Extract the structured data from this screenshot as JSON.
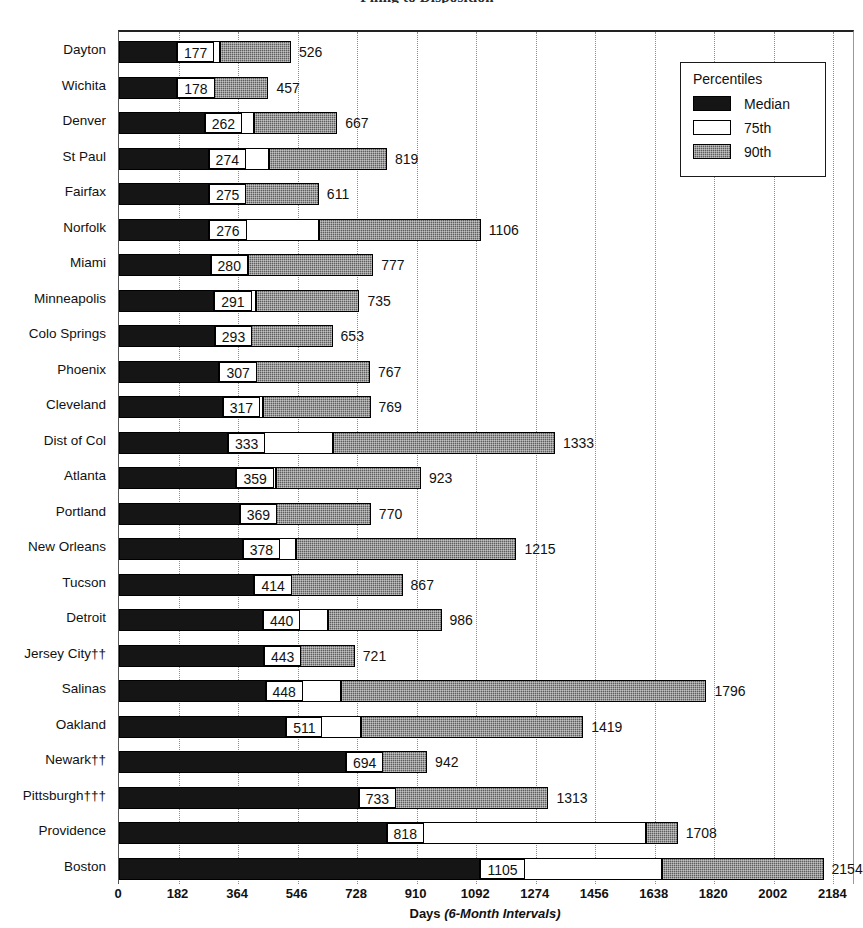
{
  "title": "Filing to Disposition",
  "legend": {
    "title": "Percentiles",
    "items": [
      {
        "label": "Median",
        "swatch": "black"
      },
      {
        "label": "75th",
        "swatch": "white"
      },
      {
        "label": "90th",
        "swatch": "hatched-gray"
      }
    ]
  },
  "axis": {
    "x_title_bold": "Days",
    "x_title_italic": "(6-Month Intervals)",
    "ticks": [
      0,
      182,
      364,
      546,
      728,
      910,
      1092,
      1274,
      1456,
      1638,
      1820,
      2002,
      2184
    ],
    "min": 0,
    "max": 2244
  },
  "chart_data": {
    "type": "bar",
    "orientation": "horizontal",
    "stacked": true,
    "title": "Filing to Disposition",
    "xlabel": "Days (6-Month Intervals)",
    "ylabel": "",
    "xlim": [
      0,
      2244
    ],
    "grid": "vertical-dotted",
    "legend_position": "top-right",
    "series": [
      {
        "name": "Median",
        "key": "median"
      },
      {
        "name": "75th",
        "key": "p75"
      },
      {
        "name": "90th",
        "key": "p90"
      }
    ],
    "categories": [
      "Dayton",
      "Wichita",
      "Denver",
      "St Paul",
      "Fairfax",
      "Norfolk",
      "Miami",
      "Minneapolis",
      "Colo Springs",
      "Phoenix",
      "Cleveland",
      "Dist of Col",
      "Atlanta",
      "Portland",
      "New Orleans",
      "Tucson",
      "Detroit",
      "Jersey City††",
      "Salinas",
      "Oakland",
      "Newark††",
      "Pittsburgh†††",
      "Providence",
      "Boston"
    ],
    "rows": [
      {
        "category": "Dayton",
        "median": 177,
        "p75": 308,
        "p90": 526
      },
      {
        "category": "Wichita",
        "median": 178,
        "p75": 215,
        "p90": 457
      },
      {
        "category": "Denver",
        "median": 262,
        "p75": 414,
        "p90": 667
      },
      {
        "category": "St Paul",
        "median": 274,
        "p75": 460,
        "p90": 819
      },
      {
        "category": "Fairfax",
        "median": 275,
        "p75": 380,
        "p90": 611
      },
      {
        "category": "Norfolk",
        "median": 276,
        "p75": 610,
        "p90": 1106
      },
      {
        "category": "Miami",
        "median": 280,
        "p75": 395,
        "p90": 777
      },
      {
        "category": "Minneapolis",
        "median": 291,
        "p75": 420,
        "p90": 735
      },
      {
        "category": "Colo Springs",
        "median": 293,
        "p75": 400,
        "p90": 653
      },
      {
        "category": "Phoenix",
        "median": 307,
        "p75": 400,
        "p90": 767
      },
      {
        "category": "Cleveland",
        "median": 317,
        "p75": 440,
        "p90": 769
      },
      {
        "category": "Dist of Col",
        "median": 333,
        "p75": 655,
        "p90": 1333
      },
      {
        "category": "Atlanta",
        "median": 359,
        "p75": 480,
        "p90": 923
      },
      {
        "category": "Portland",
        "median": 369,
        "p75": 470,
        "p90": 770
      },
      {
        "category": "New Orleans",
        "median": 378,
        "p75": 540,
        "p90": 1215
      },
      {
        "category": "Tucson",
        "median": 414,
        "p75": 520,
        "p90": 867
      },
      {
        "category": "Detroit",
        "median": 440,
        "p75": 640,
        "p90": 986
      },
      {
        "category": "Jersey City††",
        "median": 443,
        "p75": 545,
        "p90": 721
      },
      {
        "category": "Salinas",
        "median": 448,
        "p75": 680,
        "p90": 1796
      },
      {
        "category": "Oakland",
        "median": 511,
        "p75": 740,
        "p90": 1419
      },
      {
        "category": "Newark††",
        "median": 694,
        "p75": 790,
        "p90": 942
      },
      {
        "category": "Pittsburgh†††",
        "median": 733,
        "p75": 838,
        "p90": 1313
      },
      {
        "category": "Providence",
        "median": 818,
        "p75": 1610,
        "p90": 1708
      },
      {
        "category": "Boston",
        "median": 1105,
        "p75": 1660,
        "p90": 2154
      }
    ]
  }
}
